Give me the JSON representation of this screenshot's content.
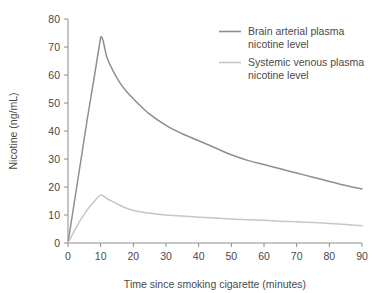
{
  "chart_data": {
    "type": "line",
    "title": "",
    "xlabel": "Time since smoking cigarette (minutes)",
    "ylabel": "Nicotine (ng/mL)",
    "xlim": [
      0,
      90
    ],
    "ylim": [
      0,
      80
    ],
    "xticks": [
      0,
      10,
      20,
      30,
      40,
      50,
      60,
      70,
      80,
      90
    ],
    "yticks": [
      0,
      10,
      20,
      30,
      40,
      50,
      60,
      70,
      80
    ],
    "xtick_labels": [
      "0",
      "10",
      "20",
      "30",
      "40",
      "50",
      "60",
      "70",
      "80",
      "90"
    ],
    "ytick_labels": [
      "0",
      "10",
      "20",
      "30",
      "40",
      "50",
      "60",
      "70",
      "80"
    ],
    "grid": false,
    "legend_position": "top-right",
    "x": [
      0,
      2,
      4,
      6,
      8,
      10,
      12,
      14,
      16,
      18,
      20,
      25,
      30,
      35,
      40,
      45,
      50,
      55,
      60,
      65,
      70,
      75,
      80,
      85,
      90
    ],
    "series": [
      {
        "name": "Brain arterial plasma nicotine level",
        "color": "#8e8e8e",
        "values": [
          0,
          15,
          30,
          45,
          59,
          73.5,
          66,
          61,
          57,
          54,
          51.5,
          46,
          42,
          39,
          36.5,
          34,
          31.5,
          29.5,
          28,
          26.5,
          25,
          23.5,
          22,
          20.5,
          19.3
        ]
      },
      {
        "name": "Systemic venous plasma nicotine level",
        "color": "#c6c6c6",
        "values": [
          0,
          4.5,
          8.5,
          12,
          14.8,
          17.1,
          15.8,
          14.6,
          13.4,
          12.4,
          11.6,
          10.6,
          10.0,
          9.6,
          9.2,
          8.9,
          8.6,
          8.3,
          8.1,
          7.8,
          7.6,
          7.3,
          7.0,
          6.6,
          6.2
        ]
      }
    ],
    "legend": [
      {
        "line1": "Brain arterial plasma",
        "line2": "nicotine level",
        "color": "#8e8e8e"
      },
      {
        "line1": "Systemic venous plasma",
        "line2": "nicotine level",
        "color": "#c6c6c6"
      }
    ]
  },
  "colors": {
    "axis": "#8c8c8c",
    "text": "#4a4a4a",
    "background": "#ffffff",
    "series_brain": "#8e8e8e",
    "series_systemic": "#c6c6c6"
  }
}
